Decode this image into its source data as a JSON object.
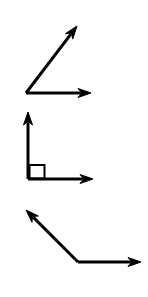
{
  "document": {
    "title": "Angle Types Figure",
    "background_color": "#ffffff",
    "stroke_color": "#000000",
    "width": 148,
    "height": 297
  },
  "figure": {
    "stroke_width": 3,
    "arrowhead_length": 13,
    "arrowhead_width": 9,
    "angles": [
      {
        "id": "acute-angle",
        "label": "acute angle",
        "measure_degrees": 45,
        "vertex": {
          "x": 26,
          "y": 93
        },
        "rays": [
          {
            "id": "acute-ray-upper",
            "label": "upper ray",
            "from": {
              "x": 26,
              "y": 93
            },
            "to": {
              "x": 77,
              "y": 26
            },
            "arrowhead": true
          },
          {
            "id": "acute-ray-horizontal",
            "label": "horizontal ray",
            "from": {
              "x": 26,
              "y": 93
            },
            "to": {
              "x": 91,
              "y": 93
            },
            "arrowhead": true
          }
        ],
        "right_angle_marker": null
      },
      {
        "id": "right-angle",
        "label": "right angle",
        "measure_degrees": 90,
        "vertex": {
          "x": 28,
          "y": 179
        },
        "rays": [
          {
            "id": "right-ray-vertical",
            "label": "vertical ray",
            "from": {
              "x": 28,
              "y": 179
            },
            "to": {
              "x": 28,
              "y": 112
            },
            "arrowhead": true
          },
          {
            "id": "right-ray-horizontal",
            "label": "horizontal ray",
            "from": {
              "x": 28,
              "y": 179
            },
            "to": {
              "x": 93,
              "y": 179
            },
            "arrowhead": true
          }
        ],
        "right_angle_marker": {
          "id": "square-marker",
          "label": "right angle square marker",
          "x": 28,
          "y": 165,
          "size": 15
        }
      },
      {
        "id": "obtuse-angle",
        "label": "obtuse angle",
        "measure_degrees": 135,
        "vertex": {
          "x": 78,
          "y": 262
        },
        "rays": [
          {
            "id": "obtuse-ray-upper-left",
            "label": "upper left ray",
            "from": {
              "x": 78,
              "y": 262
            },
            "to": {
              "x": 26,
              "y": 210
            },
            "arrowhead": true
          },
          {
            "id": "obtuse-ray-right",
            "label": "right ray",
            "from": {
              "x": 78,
              "y": 262
            },
            "to": {
              "x": 141,
              "y": 262
            },
            "arrowhead": true
          }
        ],
        "right_angle_marker": null
      }
    ]
  }
}
